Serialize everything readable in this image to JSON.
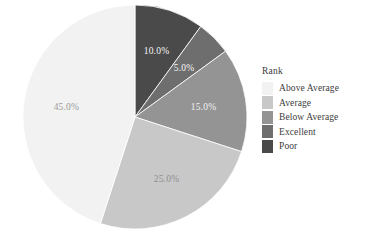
{
  "chart_data": {
    "type": "pie",
    "title": "",
    "xlabel": "",
    "ylabel": "",
    "legend_title": "Rank",
    "legend_position": "right",
    "grid": false,
    "start_angle_deg": 0,
    "direction": "clockwise",
    "categories": [
      "Poor",
      "Excellent",
      "Below Average",
      "Average",
      "Above Average"
    ],
    "values": [
      10.0,
      5.0,
      15.0,
      25.0,
      45.0
    ],
    "slices": [
      {
        "name": "Poor",
        "value": 10.0,
        "label": "10.0%",
        "color": "#4a4a4a",
        "label_color": "#f5f5f5"
      },
      {
        "name": "Excellent",
        "value": 5.0,
        "label": "5.0%",
        "color": "#6e6e6e",
        "label_color": "#f5f5f5"
      },
      {
        "name": "Below Average",
        "value": 15.0,
        "label": "15.0%",
        "color": "#949494",
        "label_color": "#f0f0f0"
      },
      {
        "name": "Average",
        "value": 25.0,
        "label": "25.0%",
        "color": "#c8c8c8",
        "label_color": "#8e8e8e"
      },
      {
        "name": "Above Average",
        "value": 45.0,
        "label": "45.0%",
        "color": "#f2f2f2",
        "label_color": "#9a9a9a"
      }
    ],
    "legend_entries": [
      {
        "label": "Above Average",
        "color": "#f2f2f2"
      },
      {
        "label": "Average",
        "color": "#c8c8c8"
      },
      {
        "label": "Below Average",
        "color": "#949494"
      },
      {
        "label": "Excellent",
        "color": "#6e6e6e"
      },
      {
        "label": "Poor",
        "color": "#4a4a4a"
      }
    ]
  },
  "caption": {
    "text": ""
  }
}
